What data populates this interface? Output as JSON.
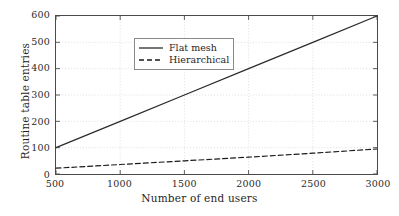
{
  "chart_data": {
    "type": "line",
    "title": "",
    "xlabel": "Number of end users",
    "ylabel": "Routine table entries",
    "xlim": [
      500,
      3000
    ],
    "ylim": [
      0,
      600
    ],
    "xticks": [
      500,
      1000,
      1500,
      2000,
      2500,
      3000
    ],
    "yticks": [
      0,
      100,
      200,
      300,
      400,
      500,
      600
    ],
    "xtick_labels": [
      "500",
      "1000",
      "1500",
      "2000",
      "2500",
      "3000"
    ],
    "ytick_labels": [
      "0",
      "100",
      "200",
      "300",
      "400",
      "500",
      "600"
    ],
    "grid": true,
    "legend_position": "upper left",
    "series": [
      {
        "name": "Flat mesh",
        "style": "solid",
        "color": "#2b2b2b",
        "x": [
          500,
          1000,
          1500,
          2000,
          2500,
          3000
        ],
        "values": [
          100,
          200,
          300,
          400,
          500,
          600
        ]
      },
      {
        "name": "Hierarchical",
        "style": "dashed",
        "color": "#1a1a1a",
        "x": [
          500,
          1000,
          1500,
          2000,
          2500,
          3000
        ],
        "values": [
          22,
          36,
          50,
          64,
          79,
          95
        ]
      }
    ]
  },
  "legend": {
    "items": [
      {
        "label": "Flat mesh"
      },
      {
        "label": "Hierarchical"
      }
    ]
  },
  "colors": {
    "axis": "#4a4a4a",
    "grid": "#c8c8c8",
    "text": "#1f1f1f",
    "background": "#ffffff"
  }
}
